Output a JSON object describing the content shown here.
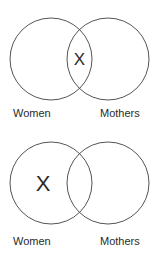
{
  "diagrams": [
    {
      "left_label": "Women",
      "right_label": "Mothers",
      "mark": "X",
      "mark_region": "intersection"
    },
    {
      "left_label": "Women",
      "right_label": "Mothers",
      "mark": "X",
      "mark_region": "left-only"
    }
  ],
  "colors": {
    "stroke": "#555555",
    "text": "#2b2b2b",
    "background": "#ffffff"
  }
}
